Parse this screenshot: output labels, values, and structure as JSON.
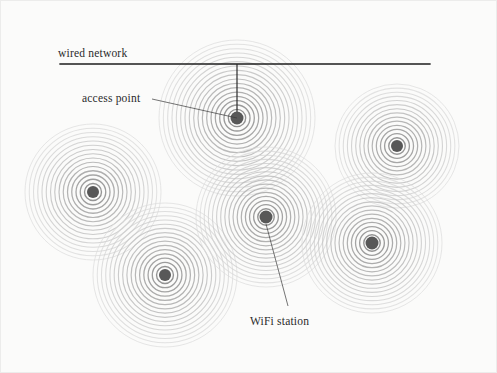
{
  "figure": {
    "background_color": "#fbfbfa",
    "width": 497,
    "height": 373,
    "line_color": "#1c1c1c",
    "node_color": "#585858",
    "ring_color_inner": "#6e6e6e",
    "ring_color_outer": "#dcdcdc"
  },
  "labels": {
    "wired_network": "wired network",
    "access_point": "access point",
    "wifi_station": "WiFi station"
  },
  "chart_data": {
    "type": "diagram",
    "wired_network": {
      "label": "wired network",
      "x1": 60,
      "y1": 64,
      "x2": 430,
      "y2": 64,
      "label_x": 58,
      "label_y": 57
    },
    "drop_line": {
      "from_x": 237,
      "from_y": 64,
      "to_x": 237,
      "to_y": 118
    },
    "nodes": [
      {
        "id": "access-point",
        "role": "access point",
        "cx": 237,
        "cy": 118,
        "radius": 78,
        "rings": 18,
        "dot_radius": 6.5
      },
      {
        "id": "station-left",
        "role": "WiFi station",
        "cx": 93,
        "cy": 192,
        "radius": 68,
        "rings": 16,
        "dot_radius": 6
      },
      {
        "id": "station-top-right",
        "role": "WiFi station",
        "cx": 397,
        "cy": 146,
        "radius": 62,
        "rings": 15,
        "dot_radius": 6
      },
      {
        "id": "station-bottom-left",
        "role": "WiFi station",
        "cx": 165,
        "cy": 275,
        "radius": 72,
        "rings": 17,
        "dot_radius": 6
      },
      {
        "id": "station-center",
        "role": "WiFi station",
        "cx": 266,
        "cy": 217,
        "radius": 70,
        "rings": 17,
        "dot_radius": 6.5
      },
      {
        "id": "station-bottom-right",
        "role": "WiFi station",
        "cx": 372,
        "cy": 243,
        "radius": 70,
        "rings": 17,
        "dot_radius": 6.5
      }
    ],
    "annotations": [
      {
        "id": "access-point-callout",
        "text": "access point",
        "text_x": 82,
        "text_y": 102,
        "anchor": "start",
        "leader": [
          [
            152,
            99
          ],
          [
            237,
            118
          ]
        ]
      },
      {
        "id": "wifi-station-callout",
        "text": "WiFi station",
        "text_x": 250,
        "text_y": 325,
        "anchor": "start",
        "leader": [
          [
            266,
            224
          ],
          [
            288,
            306
          ]
        ]
      }
    ]
  }
}
